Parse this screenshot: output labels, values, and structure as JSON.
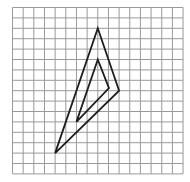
{
  "diagram": {
    "type": "grid-with-triangles",
    "grid": {
      "cols": 16,
      "rows": 16,
      "origin_px": [
        12.5,
        7.5
      ],
      "cell_px": [
        10.66,
        10.4
      ],
      "line_color": "#9a9a9a",
      "line_width": 1
    },
    "shapes": [
      {
        "name": "outer-triangle",
        "vertices_grid": [
          [
            8,
            2
          ],
          [
            10,
            8
          ],
          [
            4,
            14
          ]
        ],
        "stroke": "#1e1e1e",
        "stroke_width": 1.8
      },
      {
        "name": "inner-triangle",
        "vertices_grid": [
          [
            8,
            5
          ],
          [
            9.05,
            7.75
          ],
          [
            6,
            11
          ]
        ],
        "stroke": "#1e1e1e",
        "stroke_width": 1.8
      }
    ]
  }
}
